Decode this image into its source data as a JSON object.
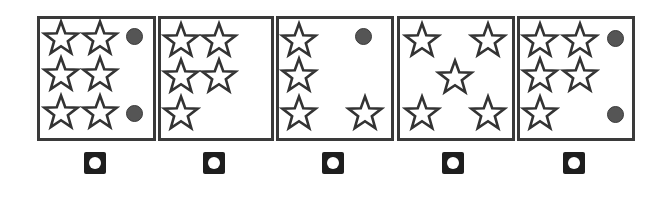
{
  "colors": {
    "background": "#ffffff",
    "panel_border": "#3a3a3a",
    "star_stroke": "#333333",
    "star_fill": "#ffffff",
    "dot_fill": "#555555",
    "button_fill": "#1e1e1e",
    "button_hole": "#ffffff"
  },
  "panels": [
    {
      "id": 1,
      "left": 37,
      "width": 113,
      "stars": [
        [
          24,
          22
        ],
        [
          63,
          22
        ],
        [
          24,
          58
        ],
        [
          63,
          58
        ],
        [
          24,
          96
        ],
        [
          63,
          96
        ]
      ],
      "dots": [
        [
          97,
          20
        ],
        [
          97,
          97
        ]
      ],
      "button_x": 95
    },
    {
      "id": 2,
      "left": 158,
      "width": 110,
      "stars": [
        [
          23,
          24
        ],
        [
          61,
          24
        ],
        [
          23,
          60
        ],
        [
          61,
          60
        ],
        [
          23,
          97
        ]
      ],
      "dots": [],
      "button_x": 214
    },
    {
      "id": 3,
      "left": 276,
      "width": 112,
      "stars": [
        [
          23,
          24
        ],
        [
          23,
          59
        ],
        [
          23,
          97
        ],
        [
          89,
          97
        ]
      ],
      "dots": [
        [
          87,
          20
        ]
      ],
      "button_x": 333
    },
    {
      "id": 4,
      "left": 397,
      "width": 112,
      "stars": [
        [
          25,
          24
        ],
        [
          91,
          24
        ],
        [
          58,
          61
        ],
        [
          25,
          97
        ],
        [
          91,
          97
        ]
      ],
      "dots": [],
      "button_x": 453
    },
    {
      "id": 5,
      "left": 517,
      "width": 112,
      "stars": [
        [
          23,
          24
        ],
        [
          63,
          24
        ],
        [
          23,
          59
        ],
        [
          63,
          59
        ],
        [
          23,
          97
        ]
      ],
      "dots": [
        [
          98,
          22
        ],
        [
          98,
          98
        ]
      ],
      "button_x": 574
    }
  ],
  "icons": {
    "star": "star-outline-icon",
    "dot": "filled-circle-icon",
    "button": "radio-select-button"
  }
}
